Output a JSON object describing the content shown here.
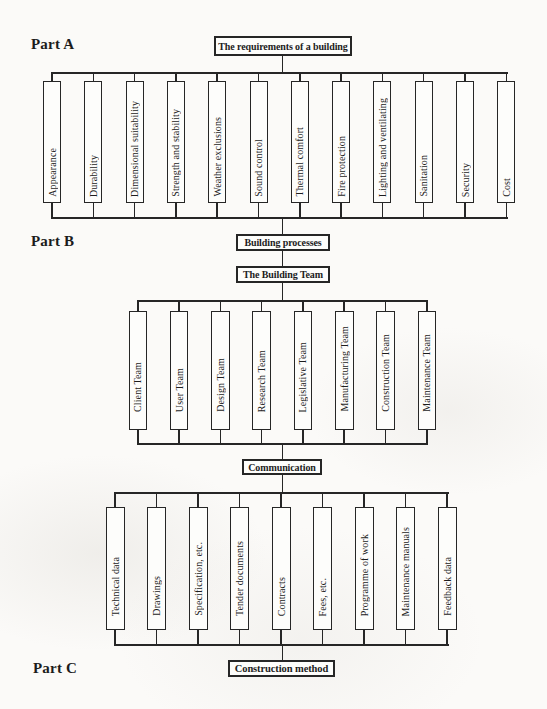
{
  "page": {
    "background": "#fbfaf8",
    "ink": "#262626"
  },
  "parts": {
    "a": {
      "label": "Part A",
      "header": "The requirements of a building",
      "items": [
        "Appearance",
        "Durability",
        "Dimensional suitability",
        "Strength and stability",
        "Weather exclusions",
        "Sound control",
        "Thermal comfort",
        "Fire protection",
        "Lighting and ventilating",
        "Sanitation",
        "Security",
        "Cost"
      ]
    },
    "b": {
      "label": "Part B",
      "headers": [
        "Building processes",
        "The Building Team"
      ],
      "items": [
        "Client Team",
        "User Team",
        "Design Team",
        "Research Team",
        "Legislative Team",
        "Manufacturing Team",
        "Construction Team",
        "Maintenance Team"
      ]
    },
    "c": {
      "label": "Part C",
      "header": "Communication",
      "footer": "Construction method",
      "items": [
        "Technical data",
        "Drawings",
        "Specification, etc.",
        "Tender documents",
        "Contracts",
        "Fees, etc.",
        "Programme of work",
        "Maintenance manuals",
        "Feedback data"
      ]
    }
  }
}
